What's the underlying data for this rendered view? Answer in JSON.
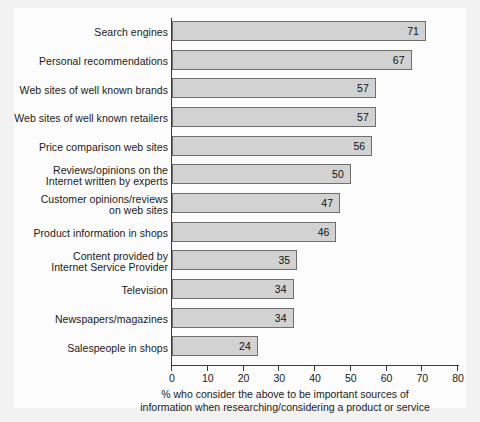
{
  "chart_data": {
    "type": "bar",
    "orientation": "horizontal",
    "title": "",
    "xlabel": "% who consider the above to be important sources of information when researching/considering a product or service",
    "ylabel": "",
    "xlim": [
      0,
      80
    ],
    "xticks": [
      0,
      10,
      20,
      30,
      40,
      50,
      60,
      70,
      80
    ],
    "grid": false,
    "legend": false,
    "categories": [
      "Search engines",
      "Personal recommendations",
      "Web sites of well known brands",
      "Web sites of well known retailers",
      "Price comparison web sites",
      "Reviews/opinions on the Internet written by experts",
      "Customer opinions/reviews on web sites",
      "Product information in shops",
      "Content provided by Internet Service Provider",
      "Television",
      "Newspapers/magazines",
      "Salespeople in shops"
    ],
    "category_lines": [
      [
        "Search engines"
      ],
      [
        "Personal recommendations"
      ],
      [
        "Web sites of well known brands"
      ],
      [
        "Web sites of well known retailers"
      ],
      [
        "Price comparison web sites"
      ],
      [
        "Reviews/opinions on the",
        "Internet written by experts"
      ],
      [
        "Customer opinions/reviews",
        "on web sites"
      ],
      [
        "Product information in shops"
      ],
      [
        "Content provided by",
        "Internet Service Provider"
      ],
      [
        "Television"
      ],
      [
        "Newspapers/magazines"
      ],
      [
        "Salespeople in shops"
      ]
    ],
    "values": [
      71,
      67,
      57,
      57,
      56,
      50,
      47,
      46,
      35,
      34,
      34,
      24
    ],
    "value_labels": [
      "71",
      "67",
      "57",
      "57",
      "56",
      "50",
      "47",
      "46",
      "35",
      "34",
      "34",
      "24"
    ]
  },
  "caption_lines": [
    "% who consider the above to be important sources of",
    "information when researching/considering a product or service"
  ],
  "colors": {
    "bar_fill": "#d2d2d2",
    "bar_border": "#6f6f6f",
    "axis": "#3a3a3a",
    "text": "#1a1a1a",
    "background": "#f2f2f2",
    "canvas": "#fcfcfc"
  }
}
